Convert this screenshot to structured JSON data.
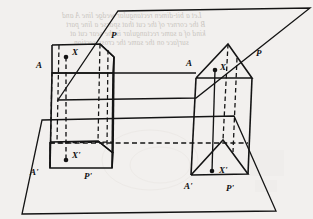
{
  "figure": {
    "caption": "",
    "ink_color": "#141414",
    "paper_color": "#f2f0ee",
    "bleed_color": "#c9c5c0"
  },
  "planes": {
    "upper": {
      "name": "upper-plane",
      "points": "118,11 310,8 196,98 58,100"
    },
    "lower": {
      "name": "lower-plane",
      "points": "42,120 234,116 276,211 22,214"
    }
  },
  "left_solid": {
    "name": "left-pentagonal-prism",
    "top_face": "52,45 100,44 114,57 100,72 52,72",
    "bottom_face": "50,142 98,141 113,153 99,168 50,168",
    "vertical_edges_solid": [
      "52,45 50,142",
      "114,57 113,153",
      "100,72 99,168",
      "52,72 50,168"
    ],
    "hidden_edges": [
      "100,44 98,141",
      "52,72 100,72",
      "100,72 114,57"
    ]
  },
  "right_solid": {
    "name": "right-triangular-prism",
    "top_face": "196,78 228,44 252,78",
    "bottom_face": "191,175 223,140 248,174",
    "vertical_edges_solid": [
      "196,78 191,175",
      "252,78 248,174",
      "228,44 223,140"
    ]
  },
  "projection_lines": {
    "left_point": "66,57 66,160",
    "right_point": "215,70 212,171"
  },
  "labels": [
    {
      "id": "label-A",
      "text": "A",
      "x": 36,
      "y": 66
    },
    {
      "id": "label-X",
      "text": "X",
      "x": 73,
      "y": 53
    },
    {
      "id": "label-P",
      "text": "P",
      "x": 112,
      "y": 34
    },
    {
      "id": "label-A-prime",
      "text": "A'",
      "x": 31,
      "y": 172
    },
    {
      "id": "label-X-prime",
      "text": "X'",
      "x": 73,
      "y": 155
    },
    {
      "id": "label-P-prime",
      "text": "P'",
      "x": 85,
      "y": 178
    },
    {
      "id": "label-A2",
      "text": "A",
      "x": 187,
      "y": 65
    },
    {
      "id": "label-X2",
      "text": "X",
      "x": 222,
      "y": 72
    },
    {
      "id": "label-P2",
      "text": "P",
      "x": 258,
      "y": 57
    },
    {
      "id": "label-A2-prime",
      "text": "A'",
      "x": 185,
      "y": 186
    },
    {
      "id": "label-X2-prime",
      "text": "X'",
      "x": 225,
      "y": 178
    },
    {
      "id": "label-P2-prime",
      "text": "P'",
      "x": 228,
      "y": 190
    }
  ],
  "dots": [
    {
      "id": "dot-X",
      "cx": 66,
      "cy": 57
    },
    {
      "id": "dot-X-prime",
      "cx": 66,
      "cy": 160
    },
    {
      "id": "dot-X2",
      "cx": 215,
      "cy": 70
    },
    {
      "id": "dot-X2-prime",
      "cx": 212,
      "cy": 171
    }
  ],
  "bleed_through": {
    "note": "faint mirrored text showing through from reverse of page",
    "lines": [
      {
        "id": "bleed-line-1",
        "text": "Let a bit-dimen  rectangular wedge line A and",
        "x": 62,
        "y": 18
      },
      {
        "id": "bleed-line-2",
        "text": "B the corner of the cut that sparse a line part",
        "x": 66,
        "y": 27
      },
      {
        "id": "bleed-line-3",
        "text": "kind of a same rectangular is the  sear cut at",
        "x": 70,
        "y": 36
      },
      {
        "id": "bleed-line-4",
        "text": "surface on the  same  the  cross-section",
        "x": 74,
        "y": 45
      }
    ]
  }
}
